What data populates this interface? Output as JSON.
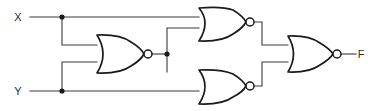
{
  "diagram": {
    "colors": {
      "background": "#ffffff",
      "wire": "#3a3a3a",
      "gate_outline": "#1a1a1a",
      "label_text": "#2b2b2b"
    },
    "inputs": [
      {
        "id": "x",
        "label": "X"
      },
      {
        "id": "y",
        "label": "Y"
      }
    ],
    "outputs": [
      {
        "id": "f",
        "label": "F"
      }
    ],
    "gates": [
      {
        "id": "nor-middle",
        "type": "NOR",
        "inputs": [
          "X",
          "Y"
        ]
      },
      {
        "id": "nor-top",
        "type": "NOR",
        "inputs": [
          "X",
          "nor-middle"
        ]
      },
      {
        "id": "nor-bottom",
        "type": "NOR",
        "inputs": [
          "nor-middle",
          "Y"
        ]
      },
      {
        "id": "nor-output",
        "type": "NOR",
        "inputs": [
          "nor-top",
          "nor-bottom"
        ]
      }
    ],
    "junctions": [
      {
        "id": "x-tap",
        "on": "X"
      },
      {
        "id": "y-tap",
        "on": "Y"
      },
      {
        "id": "mid-tap",
        "on": "nor-middle-output"
      }
    ]
  }
}
